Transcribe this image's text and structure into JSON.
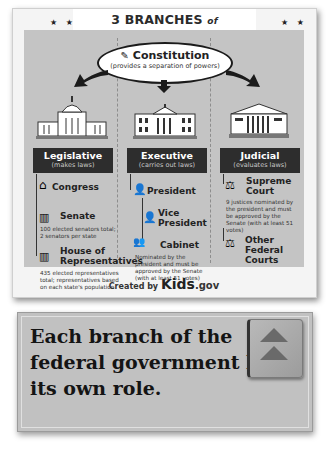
{
  "poster": {
    "title_prefix": "3 BRANCHES",
    "title_of": "of",
    "title_suffix": "GOVERNMENT",
    "stars_left": "★ ★",
    "stars_right": "★ ★",
    "constitution": {
      "title": "Constitution",
      "subtitle": "(provides a separation of powers)"
    },
    "branches": [
      {
        "name": "Legislative",
        "role": "(makes laws)",
        "items": [
          {
            "label": "Congress"
          },
          {
            "label": "Senate",
            "note": "100 elected senators total; 2 senators per state"
          },
          {
            "label": "House of Representatives",
            "note": "435 elected representatives total; representatives based on each state's population"
          }
        ]
      },
      {
        "name": "Executive",
        "role": "(carries out laws)",
        "items": [
          {
            "label": "President"
          },
          {
            "label": "Vice President"
          },
          {
            "label": "Cabinet",
            "note": "Nominated by the president and must be approved by the Senate (with at least 51 votes)"
          }
        ]
      },
      {
        "name": "Judicial",
        "role": "(evaluates laws)",
        "items": [
          {
            "label": "Supreme Court",
            "note": "9 justices nominated by the president and must be approved by the Senate (with at least 51 votes)"
          },
          {
            "label": "Other Federal Courts"
          }
        ]
      }
    ],
    "footer": {
      "created_by": "Created by",
      "brand": "Kids",
      "domain": ".gov"
    }
  },
  "caption": {
    "text": "Each branch of the federal government has its own role."
  },
  "nav": {
    "button_icon": "double-chevron-up-icon"
  }
}
